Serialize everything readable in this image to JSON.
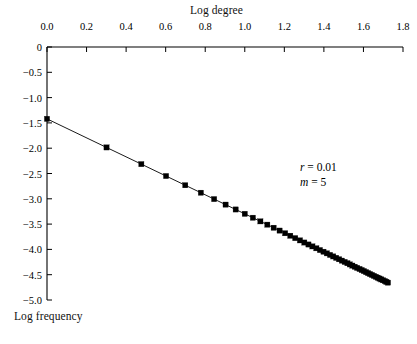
{
  "figure": {
    "background_color": "#ffffff",
    "foreground_color": "#000000"
  },
  "chart_data": {
    "type": "scatter",
    "title": "",
    "xlabel": "Log degree",
    "ylabel": "Log frequency",
    "xlim": [
      0.0,
      1.8
    ],
    "ylim": [
      -5.0,
      0.0
    ],
    "grid": false,
    "legend": null,
    "x_axis_position": "top",
    "y_axis_position": "left",
    "xticks": [
      "0.0",
      "0.2",
      "0.4",
      "0.6",
      "0.8",
      "1.0",
      "1.2",
      "1.4",
      "1.6",
      "1.8"
    ],
    "xtick_values": [
      0.0,
      0.2,
      0.4,
      0.6,
      0.8,
      1.0,
      1.2,
      1.4,
      1.6,
      1.8
    ],
    "yticks": [
      "0",
      "−0.5",
      "−1.0",
      "−1.5",
      "−2.0",
      "−2.5",
      "−3.0",
      "−3.5",
      "−4.0",
      "−4.5",
      "−5.0"
    ],
    "ytick_values": [
      0.0,
      -0.5,
      -1.0,
      -1.5,
      -2.0,
      -2.5,
      -3.0,
      -3.5,
      -4.0,
      -4.5,
      -5.0
    ],
    "marker": "square",
    "marker_color": "#000000",
    "line_color": "#000000",
    "series": [
      {
        "name": "log-log degree distribution",
        "x": [
          0.0,
          0.301,
          0.477,
          0.602,
          0.699,
          0.778,
          0.845,
          0.903,
          0.954,
          1.0,
          1.041,
          1.079,
          1.114,
          1.146,
          1.176,
          1.204,
          1.23,
          1.255,
          1.279,
          1.301,
          1.322,
          1.342,
          1.362,
          1.38,
          1.398,
          1.415,
          1.431,
          1.447,
          1.462,
          1.477,
          1.491,
          1.505,
          1.519,
          1.531,
          1.544,
          1.556,
          1.568,
          1.58,
          1.591,
          1.602,
          1.613,
          1.623,
          1.633,
          1.643,
          1.653,
          1.663,
          1.672,
          1.681,
          1.69,
          1.699,
          1.708,
          1.716,
          1.724
        ],
        "y": [
          -1.42,
          -1.985,
          -2.315,
          -2.55,
          -2.732,
          -2.88,
          -3.006,
          -3.115,
          -3.211,
          -3.297,
          -3.374,
          -3.446,
          -3.511,
          -3.572,
          -3.628,
          -3.681,
          -3.73,
          -3.777,
          -3.822,
          -3.864,
          -3.903,
          -3.941,
          -3.978,
          -4.013,
          -4.046,
          -4.078,
          -4.109,
          -4.139,
          -4.167,
          -4.195,
          -4.222,
          -4.248,
          -4.273,
          -4.297,
          -4.32,
          -4.343,
          -4.365,
          -4.387,
          -4.408,
          -4.428,
          -4.449,
          -4.468,
          -4.487,
          -4.505,
          -4.524,
          -4.542,
          -4.559,
          -4.576,
          -4.593,
          -4.61,
          -4.626,
          -4.642,
          -4.657
        ]
      }
    ],
    "annotations": [
      {
        "id": "r",
        "symbol": "r",
        "operator": "=",
        "value": "0.01",
        "text": "r = 0.01"
      },
      {
        "id": "m",
        "symbol": "m",
        "operator": "=",
        "value": "5",
        "text": "m = 5"
      }
    ]
  }
}
